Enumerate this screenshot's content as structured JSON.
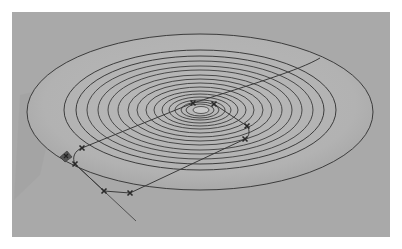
{
  "viewport": {
    "background": "#a9a9a9",
    "description": "3D CAD viewport showing a shaded disk with concentric contour rings and a toolpath"
  },
  "disk": {
    "outer_rim": {
      "cx": 200,
      "cy": 112,
      "rx": 173,
      "ry": 78
    },
    "surface_fill": "#b4b4b4",
    "shadow_fill": "#9d9d9d",
    "contour_color": "#3c3c3c",
    "rings": [
      {
        "cx": 200,
        "cy": 110,
        "rx": 136,
        "ry": 60
      },
      {
        "cx": 200,
        "cy": 110,
        "rx": 124,
        "ry": 54
      },
      {
        "cx": 200,
        "cy": 110,
        "rx": 113,
        "ry": 49
      },
      {
        "cx": 200,
        "cy": 110,
        "rx": 102,
        "ry": 44
      },
      {
        "cx": 200,
        "cy": 110,
        "rx": 92,
        "ry": 40
      },
      {
        "cx": 200,
        "cy": 110,
        "rx": 82,
        "ry": 35
      },
      {
        "cx": 200,
        "cy": 110,
        "rx": 72,
        "ry": 31
      },
      {
        "cx": 200,
        "cy": 110,
        "rx": 63,
        "ry": 27
      },
      {
        "cx": 200,
        "cy": 110,
        "rx": 54,
        "ry": 23
      },
      {
        "cx": 200,
        "cy": 110,
        "rx": 46,
        "ry": 19
      },
      {
        "cx": 200,
        "cy": 110,
        "rx": 38,
        "ry": 16
      },
      {
        "cx": 200,
        "cy": 110,
        "rx": 31,
        "ry": 13
      },
      {
        "cx": 200,
        "cy": 110,
        "rx": 25,
        "ry": 10
      },
      {
        "cx": 200,
        "cy": 110,
        "rx": 19,
        "ry": 8
      },
      {
        "cx": 200,
        "cy": 110,
        "rx": 14,
        "ry": 6
      }
    ],
    "center_hole": {
      "cx": 201,
      "cy": 110,
      "rx": 8,
      "ry": 3.5
    }
  },
  "toolpath": {
    "color": "#3a3a3a",
    "path": "M 320 58 C 300 70, 250 85, 193 103 L 82 148 C 74 151, 72 158, 75 164 L 104 191 L 130 193 L 245 139 C 250 136, 250 130, 247 126 L 214 104",
    "lead_line": "M 75 164 L 136 221",
    "markers": [
      {
        "x": 82,
        "y": 148
      },
      {
        "x": 75,
        "y": 164
      },
      {
        "x": 104,
        "y": 191
      },
      {
        "x": 130,
        "y": 193
      },
      {
        "x": 245,
        "y": 139
      },
      {
        "x": 247,
        "y": 126
      },
      {
        "x": 193,
        "y": 103
      },
      {
        "x": 214,
        "y": 104
      }
    ]
  },
  "gizmo": {
    "x": 66,
    "y": 156,
    "color": "#555555"
  }
}
